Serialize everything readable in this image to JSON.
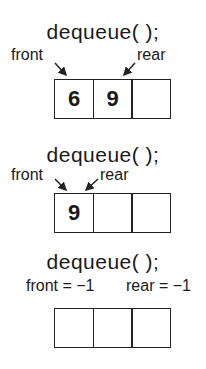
{
  "panels": [
    {
      "title": "dequeue( );",
      "front_label": "front",
      "rear_label": "rear",
      "cells": [
        "6",
        "9",
        ""
      ]
    },
    {
      "title": "dequeue( );",
      "front_label": "front",
      "rear_label": "rear",
      "cells": [
        "9",
        "",
        ""
      ]
    },
    {
      "title": "dequeue( );",
      "front_label": "front = −1",
      "rear_label": "rear = −1",
      "cells": [
        "",
        "",
        ""
      ]
    }
  ]
}
